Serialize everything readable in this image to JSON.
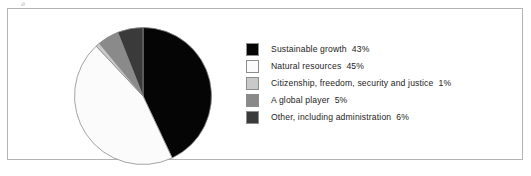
{
  "figure": {
    "top_artifact": "⌀"
  },
  "chart_data": {
    "type": "pie",
    "title": "",
    "xlabel": "",
    "ylabel": "",
    "start_angle_deg": 0,
    "direction": "clockwise",
    "legend_position": "right",
    "grid": false,
    "unit": "%",
    "categories": [
      "Sustainable growth",
      "Natural resources",
      "Citizenship, freedom, security and justice",
      "A global player",
      "Other, including administration"
    ],
    "values": [
      43,
      45,
      1,
      5,
      6
    ],
    "value_labels": [
      "43%",
      "45%",
      "1%",
      "5%",
      "6%"
    ],
    "colors": [
      "#050505",
      "#fbfbfb",
      "#c9c9c9",
      "#8a8a8a",
      "#3a3a3a"
    ],
    "slice_stroke": "#8d8d8d",
    "slices": [
      {
        "label": "Sustainable growth",
        "value": 43,
        "value_label": "43%",
        "color": "#050505"
      },
      {
        "label": "Natural resources",
        "value": 45,
        "value_label": "45%",
        "color": "#fbfbfb"
      },
      {
        "label": "Citizenship, freedom, security and justice",
        "value": 1,
        "value_label": "1%",
        "color": "#c9c9c9"
      },
      {
        "label": "A global player",
        "value": 5,
        "value_label": "5%",
        "color": "#8a8a8a"
      },
      {
        "label": "Other, including administration",
        "value": 6,
        "value_label": "6%",
        "color": "#3a3a3a"
      }
    ]
  }
}
